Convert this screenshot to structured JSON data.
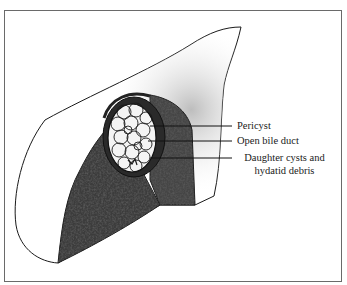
{
  "figure": {
    "type": "anatomical-illustration",
    "colors": {
      "frame": "#6a6a6a",
      "outline": "#1a1a1a",
      "parenchyma_cut": "#3a3a3a",
      "surface": "#f4f4f4",
      "cyst_fill": "#f2f2f2"
    },
    "labels": [
      {
        "id": "pericyst",
        "text": "Pericyst"
      },
      {
        "id": "open-bile-duct",
        "text": "Open bile duct"
      },
      {
        "id": "daughter-cysts",
        "line1": "Daughter cysts and",
        "line2": "hydatid debris"
      }
    ]
  }
}
